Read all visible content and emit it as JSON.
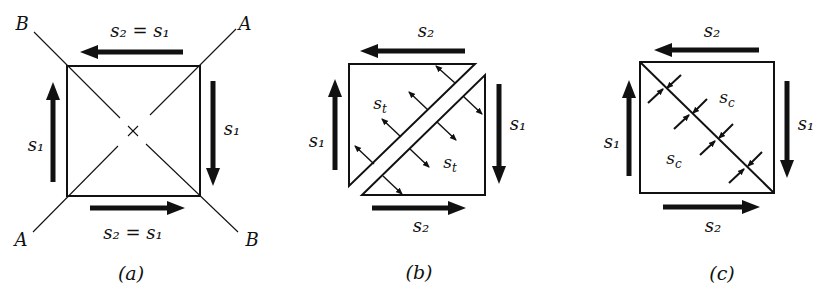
{
  "figure": {
    "panels": [
      {
        "id": "a",
        "caption": "(a)",
        "top_label": "s₂ = s₁",
        "bottom_label": "s₂ = s₁",
        "left_label": "s₁",
        "right_label": "s₁",
        "corner_labels": {
          "top_left": "B",
          "top_right": "A",
          "bottom_left": "A",
          "bottom_right": "B"
        },
        "center_marker": "×"
      },
      {
        "id": "b",
        "caption": "(b)",
        "top_label": "s₂",
        "bottom_label": "s₂",
        "left_label": "s₁",
        "right_label": "s₁",
        "region_labels": [
          "sₜ",
          "sₜ"
        ],
        "region_label_base": "s",
        "region_label_sub": "t"
      },
      {
        "id": "c",
        "caption": "(c)",
        "top_label": "s₂",
        "bottom_label": "s₂",
        "left_label": "s₁",
        "right_label": "s₁",
        "region_label_base": "s",
        "region_label_sub": "c"
      }
    ],
    "colors": {
      "ink": "#111111",
      "background": "#ffffff"
    }
  }
}
